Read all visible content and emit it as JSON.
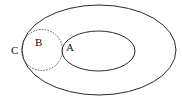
{
  "diagram": {
    "type": "set-relationship",
    "shapes": {
      "outer_ellipse": {
        "cx": 99,
        "cy": 50,
        "rx": 77,
        "ry": 45,
        "stroke": "#111111",
        "style": "solid"
      },
      "inner_ellipse": {
        "cx": 98.5,
        "cy": 51,
        "rx": 36.5,
        "ry": 20,
        "stroke": "#111111",
        "style": "solid"
      },
      "dashed_circle": {
        "cx": 42,
        "cy": 50,
        "r": 20.5,
        "stroke": "#333333",
        "style": "dashed"
      }
    },
    "labels": {
      "a": "A",
      "b": "B",
      "c": "C"
    }
  }
}
